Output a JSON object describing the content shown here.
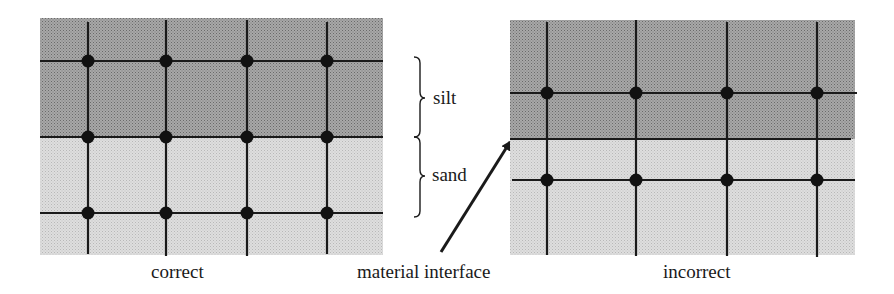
{
  "figure": {
    "left_panel": {
      "caption": "correct",
      "layers": [
        {
          "name": "silt",
          "fill": "#9a9a9a"
        },
        {
          "name": "sand",
          "fill": "#d4d4d4"
        }
      ],
      "grid_columns": 4,
      "grid_rows": 3,
      "note": "mesh nodes lie on the material interface"
    },
    "right_panel": {
      "caption": "incorrect",
      "layers": [
        {
          "name": "silt",
          "fill": "#9a9a9a"
        },
        {
          "name": "sand",
          "fill": "#d4d4d4"
        }
      ],
      "grid_columns": 4,
      "grid_rows": 2,
      "note": "mesh nodes do not lie on the material interface"
    },
    "brace_labels": {
      "silt": "silt",
      "sand": "sand"
    },
    "arrow_label": "material interface",
    "colors": {
      "silt": "#9a9a9a",
      "sand": "#d4d4d4",
      "lines": "#1a1a1a",
      "nodes": "#111111"
    }
  }
}
